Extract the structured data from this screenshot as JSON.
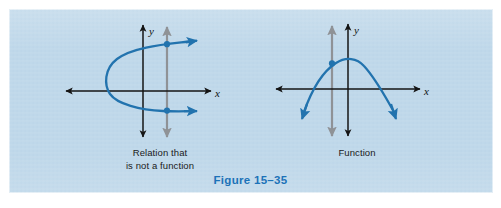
{
  "figure": {
    "caption": "Figure 15–35",
    "caption_color": "#1c72b8",
    "panel_background": "#bfd8ea"
  },
  "colors": {
    "curve_blue": "#2273ae",
    "axis_black": "#141414",
    "test_line_gray": "#8f9296",
    "text_black": "#1a1a1a"
  },
  "panels": {
    "left": {
      "caption": "Relation that\nis not a function",
      "x_axis_label": "x",
      "y_axis_label": "y",
      "curve_type": "sideways-parabola",
      "vertical_line_test": "fails",
      "intersection_points": 2
    },
    "right": {
      "caption": "Function",
      "x_axis_label": "x",
      "y_axis_label": "y",
      "curve_type": "downward-parabola",
      "vertical_line_test": "passes",
      "intersection_points": 1
    }
  }
}
